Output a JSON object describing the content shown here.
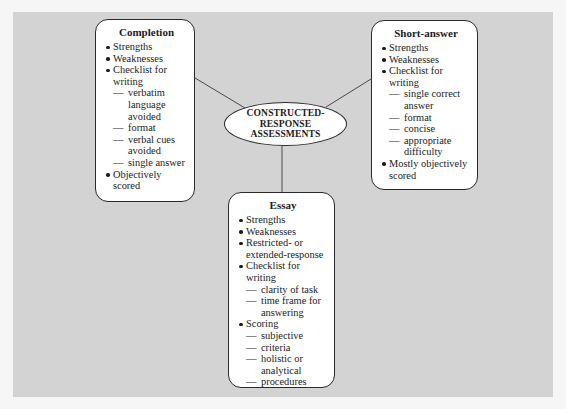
{
  "diagram": {
    "center": {
      "lines": [
        "CONSTRUCTED-",
        "RESPONSE",
        "ASSESSMENTS"
      ]
    },
    "nodes": [
      {
        "title": "Completion",
        "items": [
          {
            "type": "bullet",
            "text": "Strengths"
          },
          {
            "type": "bullet",
            "text": "Weaknesses"
          },
          {
            "type": "bullet",
            "text": "Checklist for writing"
          },
          {
            "type": "sub",
            "text": "verbatim language avoided"
          },
          {
            "type": "sub",
            "text": "format"
          },
          {
            "type": "sub",
            "text": "verbal cues avoided"
          },
          {
            "type": "sub",
            "text": "single answer"
          },
          {
            "type": "bullet",
            "text": "Objectively scored"
          }
        ]
      },
      {
        "title": "Short-answer",
        "items": [
          {
            "type": "bullet",
            "text": "Strengths"
          },
          {
            "type": "bullet",
            "text": "Weaknesses"
          },
          {
            "type": "bullet",
            "text": "Checklist for writing"
          },
          {
            "type": "sub",
            "text": "single correct answer"
          },
          {
            "type": "sub",
            "text": "format"
          },
          {
            "type": "sub",
            "text": "concise"
          },
          {
            "type": "sub",
            "text": "appropriate difficulty"
          },
          {
            "type": "bullet",
            "text": "Mostly objectively scored"
          }
        ]
      },
      {
        "title": "Essay",
        "items": [
          {
            "type": "bullet",
            "text": "Strengths"
          },
          {
            "type": "bullet",
            "text": "Weaknesses"
          },
          {
            "type": "bullet",
            "text": "Restricted- or extended-response"
          },
          {
            "type": "bullet",
            "text": "Checklist for writing"
          },
          {
            "type": "sub",
            "text": "clarity of task"
          },
          {
            "type": "sub",
            "text": "time frame for answering"
          },
          {
            "type": "bullet",
            "text": "Scoring"
          },
          {
            "type": "sub",
            "text": "subjective"
          },
          {
            "type": "sub",
            "text": "criteria"
          },
          {
            "type": "sub",
            "text": "holistic or analytical"
          },
          {
            "type": "sub",
            "text": "procedures"
          }
        ]
      }
    ],
    "dash_glyph": "—",
    "colors": {
      "panel": "#d3d3d3",
      "box_fill": "#ffffff",
      "stroke": "#2a2a2a",
      "connector": "#4a4a4a"
    }
  }
}
